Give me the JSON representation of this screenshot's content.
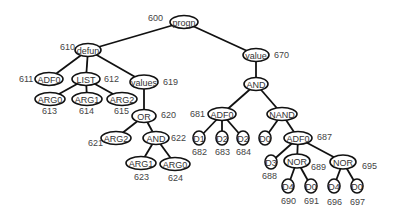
{
  "diagram": {
    "type": "tree",
    "nodes": [
      {
        "id": "n600",
        "label": "progn",
        "ref": "600",
        "x": 184,
        "y": 22,
        "rx": 14,
        "ry": 6.5,
        "refx": 148,
        "refy": 18
      },
      {
        "id": "n610",
        "label": "defun",
        "ref": "610",
        "x": 88,
        "y": 50,
        "rx": 13,
        "ry": 6.5,
        "refx": 60,
        "refy": 47
      },
      {
        "id": "n670",
        "label": "value",
        "ref": "670",
        "x": 256,
        "y": 55,
        "rx": 13,
        "ry": 6.5,
        "refx": 274,
        "refy": 55
      },
      {
        "id": "n611",
        "label": "ADF0",
        "ref": "611",
        "x": 49,
        "y": 79,
        "rx": 14,
        "ry": 6.5,
        "refx": 19,
        "refy": 79
      },
      {
        "id": "n612",
        "label": "LIST",
        "ref": "612",
        "x": 86,
        "y": 79,
        "rx": 14,
        "ry": 6.5,
        "refx": 104,
        "refy": 79
      },
      {
        "id": "n619",
        "label": "values",
        "ref": "619",
        "x": 144,
        "y": 82,
        "rx": 14,
        "ry": 7,
        "refx": 163,
        "refy": 82
      },
      {
        "id": "n613",
        "label": "ARG0",
        "ref": "613",
        "x": 50,
        "y": 99,
        "rx": 15,
        "ry": 6.5,
        "refx": 42,
        "refy": 111
      },
      {
        "id": "n614",
        "label": "ARG1",
        "ref": "614",
        "x": 87,
        "y": 99,
        "rx": 15,
        "ry": 6.5,
        "refx": 79,
        "refy": 111
      },
      {
        "id": "n615",
        "label": "ARG2",
        "ref": "615",
        "x": 122,
        "y": 99,
        "rx": 15,
        "ry": 6.5,
        "refx": 114,
        "refy": 111
      },
      {
        "id": "n620",
        "label": "OR",
        "ref": "620",
        "x": 144,
        "y": 116,
        "rx": 12,
        "ry": 6.5,
        "refx": 161,
        "refy": 115
      },
      {
        "id": "n621",
        "label": "ARG2",
        "ref": "621",
        "x": 116,
        "y": 138,
        "rx": 15,
        "ry": 6.5,
        "refx": 88,
        "refy": 143
      },
      {
        "id": "n622",
        "label": "AND",
        "ref": "622",
        "x": 156,
        "y": 138,
        "rx": 13,
        "ry": 6.5,
        "refx": 171,
        "refy": 138
      },
      {
        "id": "n623",
        "label": "ARG1",
        "ref": "623",
        "x": 141,
        "y": 163,
        "rx": 15,
        "ry": 6.5,
        "refx": 134,
        "refy": 177
      },
      {
        "id": "n624",
        "label": "ARG0",
        "ref": "624",
        "x": 175,
        "y": 164,
        "rx": 15,
        "ry": 6.5,
        "refx": 168,
        "refy": 178
      },
      {
        "id": "n681_and",
        "label": "AND",
        "ref": "",
        "x": 256,
        "y": 84,
        "rx": 12,
        "ry": 6.5,
        "refx": 0,
        "refy": 0
      },
      {
        "id": "n681",
        "label": "ADF0",
        "ref": "681",
        "x": 222,
        "y": 114,
        "rx": 14,
        "ry": 6.5,
        "refx": 190,
        "refy": 114
      },
      {
        "id": "nNAND",
        "label": "NAND",
        "ref": "",
        "x": 282,
        "y": 114,
        "rx": 15,
        "ry": 6.5,
        "refx": 0,
        "refy": 0
      },
      {
        "id": "n682",
        "label": "D1",
        "ref": "682",
        "x": 199,
        "y": 138,
        "rx": 6,
        "ry": 7,
        "refx": 192,
        "refy": 152
      },
      {
        "id": "n683",
        "label": "D2",
        "ref": "683",
        "x": 222,
        "y": 138,
        "rx": 6,
        "ry": 7,
        "refx": 215,
        "refy": 152
      },
      {
        "id": "n684",
        "label": "D2",
        "ref": "684",
        "x": 243,
        "y": 138,
        "rx": 6,
        "ry": 7,
        "refx": 236,
        "refy": 152
      },
      {
        "id": "nD0",
        "label": "D0",
        "ref": "",
        "x": 265,
        "y": 138,
        "rx": 6,
        "ry": 7,
        "refx": 0,
        "refy": 0
      },
      {
        "id": "n687",
        "label": "ADF0",
        "ref": "687",
        "x": 298,
        "y": 138,
        "rx": 14,
        "ry": 6.5,
        "refx": 317,
        "refy": 137
      },
      {
        "id": "n688",
        "label": "D3",
        "ref": "688",
        "x": 271,
        "y": 162,
        "rx": 6,
        "ry": 7,
        "refx": 262,
        "refy": 176
      },
      {
        "id": "n689",
        "label": "NOR",
        "ref": "689",
        "x": 297,
        "y": 161,
        "rx": 13,
        "ry": 7,
        "refx": 311,
        "refy": 167
      },
      {
        "id": "n695",
        "label": "NOR",
        "ref": "695",
        "x": 343,
        "y": 162,
        "rx": 13,
        "ry": 7,
        "refx": 362,
        "refy": 166
      },
      {
        "id": "n690",
        "label": "D4",
        "ref": "690",
        "x": 288,
        "y": 186,
        "rx": 6,
        "ry": 7,
        "refx": 281,
        "refy": 201
      },
      {
        "id": "n691",
        "label": "D0",
        "ref": "691",
        "x": 311,
        "y": 186,
        "rx": 6,
        "ry": 7,
        "refx": 304,
        "refy": 201
      },
      {
        "id": "n696",
        "label": "D4",
        "ref": "696",
        "x": 334,
        "y": 186,
        "rx": 6,
        "ry": 7,
        "refx": 327,
        "refy": 202
      },
      {
        "id": "n697",
        "label": "D0",
        "ref": "697",
        "x": 357,
        "y": 186,
        "rx": 6,
        "ry": 7,
        "refx": 350,
        "refy": 202
      }
    ],
    "edges": [
      [
        "n600",
        "n610"
      ],
      [
        "n600",
        "n670"
      ],
      [
        "n610",
        "n611"
      ],
      [
        "n610",
        "n612"
      ],
      [
        "n610",
        "n619"
      ],
      [
        "n612",
        "n613"
      ],
      [
        "n612",
        "n614"
      ],
      [
        "n612",
        "n615"
      ],
      [
        "n619",
        "n620"
      ],
      [
        "n620",
        "n621"
      ],
      [
        "n620",
        "n622"
      ],
      [
        "n622",
        "n623"
      ],
      [
        "n622",
        "n624"
      ],
      [
        "n670",
        "n681_and"
      ],
      [
        "n681_and",
        "n681"
      ],
      [
        "n681_and",
        "nNAND"
      ],
      [
        "n681",
        "n682"
      ],
      [
        "n681",
        "n683"
      ],
      [
        "n681",
        "n684"
      ],
      [
        "nNAND",
        "nD0"
      ],
      [
        "nNAND",
        "n687"
      ],
      [
        "n687",
        "n688"
      ],
      [
        "n687",
        "n689"
      ],
      [
        "n687",
        "n695"
      ],
      [
        "n689",
        "n690"
      ],
      [
        "n689",
        "n691"
      ],
      [
        "n695",
        "n696"
      ],
      [
        "n695",
        "n697"
      ]
    ]
  }
}
